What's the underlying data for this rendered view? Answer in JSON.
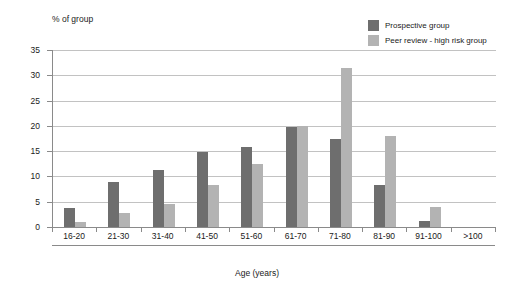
{
  "chart_data": {
    "type": "bar",
    "title": "",
    "ylabel": "% of group",
    "xlabel": "Age (years)",
    "categories": [
      "16-20",
      "21-30",
      "31-40",
      "41-50",
      "51-60",
      "61-70",
      "71-80",
      "81-90",
      "91-100",
      ">100"
    ],
    "series": [
      {
        "name": "Prospective group",
        "color": "#6e6e6e",
        "values": [
          3.8,
          9.0,
          11.2,
          14.8,
          15.8,
          19.8,
          17.5,
          8.3,
          1.2,
          0
        ]
      },
      {
        "name": "Peer review - high risk group",
        "color": "#b3b3b3",
        "values": [
          1.0,
          2.8,
          4.5,
          8.3,
          12.5,
          20.0,
          31.4,
          18.0,
          4.0,
          0
        ]
      }
    ],
    "ylim": [
      0,
      35
    ],
    "yticks": [
      0,
      5,
      10,
      15,
      20,
      25,
      30,
      35
    ],
    "ytick_labels": [
      "0",
      "5",
      "10",
      "15",
      "20",
      "25",
      "30",
      "35"
    ],
    "grid": true,
    "legend_position": "top-right"
  },
  "legend": {
    "items": [
      {
        "label": "Prospective group",
        "swatch_color": "#6e6e6e"
      },
      {
        "label": "Peer review - high risk group",
        "swatch_color": "#b3b3b3"
      }
    ]
  },
  "axes": {
    "y_axis_title": "% of group",
    "x_axis_title": "Age (years)"
  }
}
